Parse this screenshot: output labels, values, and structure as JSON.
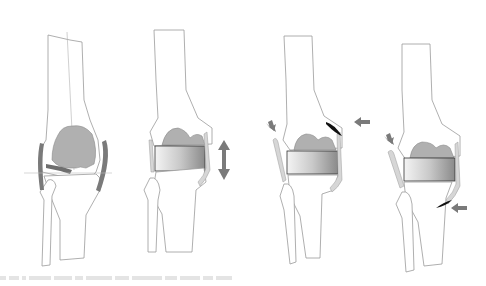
{
  "figure": {
    "colors": {
      "bone_outline": "#9a9a9a",
      "condyle_fill": "#b8b8b8",
      "ligament_dark": "#7a7a7a",
      "ligament_light": "#d6d6d6",
      "arrow": "#808080",
      "release_mark": "#1a1a1a",
      "spacer_light": "#f2f2f2",
      "spacer_dark": "#8c8c8c"
    },
    "panels": [
      {
        "id": "panel-1",
        "label": "Native knee with tight medial structures and joint line",
        "has_spacer": false,
        "arrows": []
      },
      {
        "id": "panel-2",
        "label": "Spacer block inserted, gap asymmetric",
        "has_spacer": true,
        "arrows": [
          "double-vertical"
        ]
      },
      {
        "id": "panel-3",
        "label": "Proximal release, arrows indicate direction",
        "has_spacer": true,
        "arrows": [
          "down-right-left-side",
          "left-right-side"
        ]
      },
      {
        "id": "panel-4",
        "label": "Distal release, arrows indicate direction",
        "has_spacer": true,
        "arrows": [
          "down-right-left-side",
          "left-right-side-low"
        ]
      }
    ],
    "caption": "illegible faint caption text"
  }
}
